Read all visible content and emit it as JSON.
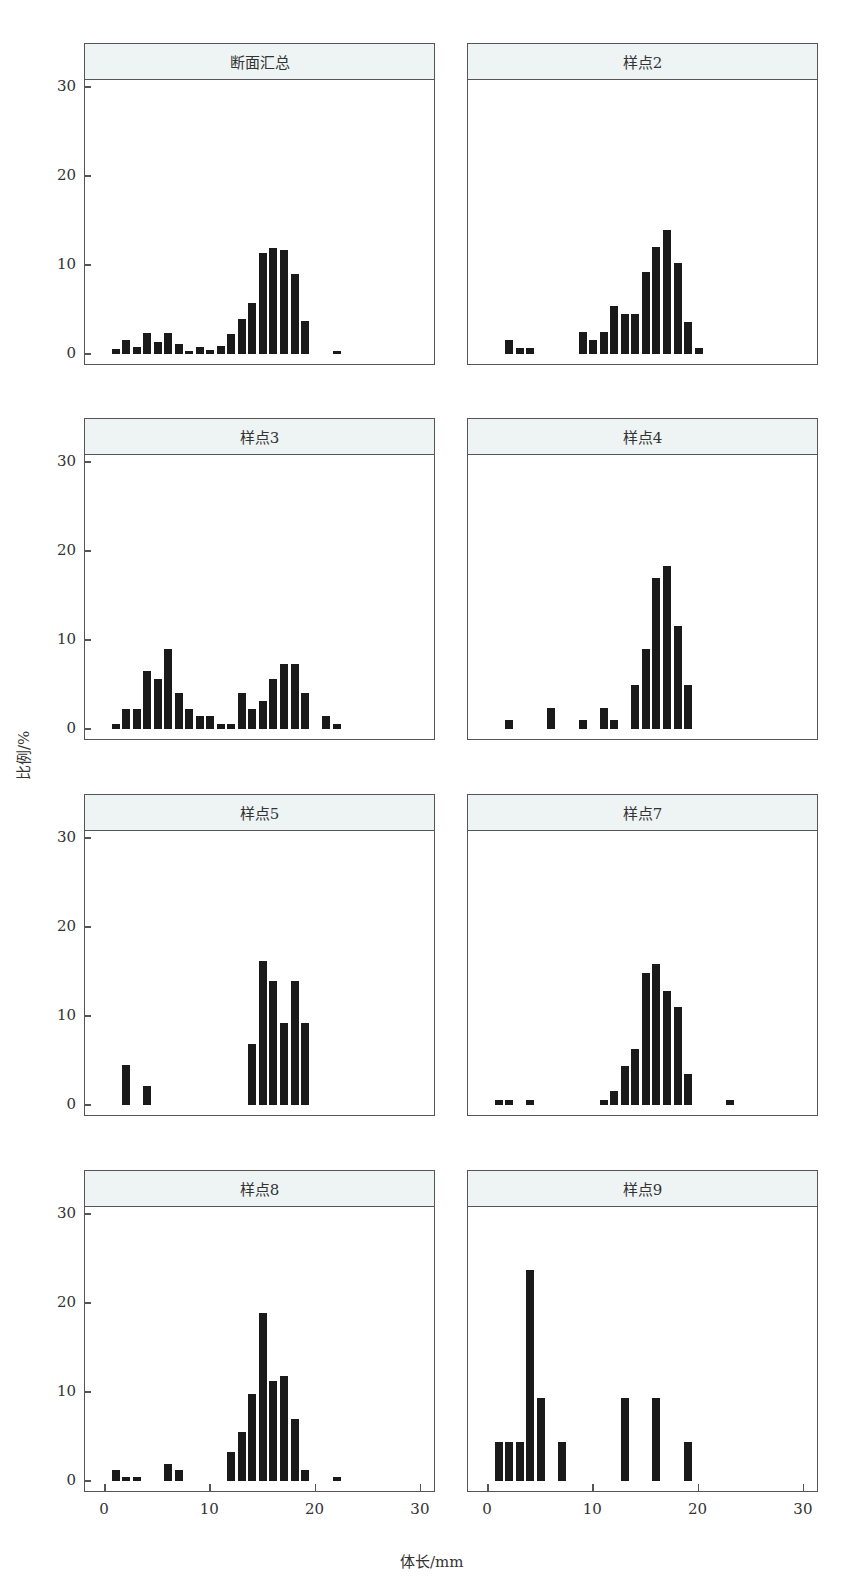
{
  "chart_data": {
    "type": "bar",
    "layout": "facet-grid 4x2",
    "xlabel": "体长/mm",
    "ylabel": "比例/%",
    "xlim": [
      -1,
      31
    ],
    "ylim": [
      0,
      30
    ],
    "xticks": [
      0,
      10,
      20,
      30
    ],
    "yticks": [
      0,
      10,
      20,
      30
    ],
    "grid": false,
    "panels": [
      {
        "title": "断面汇总",
        "x": [
          1,
          2,
          3,
          4,
          5,
          6,
          7,
          8,
          9,
          10,
          11,
          12,
          13,
          14,
          15,
          16,
          17,
          18,
          19,
          22
        ],
        "values": [
          0.6,
          1.6,
          0.8,
          2.4,
          1.3,
          2.4,
          1.1,
          0.3,
          0.8,
          0.5,
          0.9,
          2.3,
          3.9,
          5.7,
          11.4,
          11.9,
          11.7,
          9.0,
          3.7,
          0.3
        ]
      },
      {
        "title": "样点2",
        "x": [
          2,
          3,
          4,
          9,
          10,
          11,
          12,
          13,
          14,
          15,
          16,
          17,
          18,
          19,
          20
        ],
        "values": [
          1.6,
          0.7,
          0.7,
          2.5,
          1.6,
          2.5,
          5.4,
          4.5,
          4.5,
          9.2,
          12.0,
          13.9,
          10.2,
          3.6,
          0.7
        ]
      },
      {
        "title": "样点3",
        "x": [
          1,
          2,
          3,
          4,
          5,
          6,
          7,
          8,
          9,
          10,
          11,
          12,
          13,
          14,
          15,
          16,
          17,
          18,
          19,
          21,
          22
        ],
        "values": [
          0.6,
          2.3,
          2.3,
          6.5,
          5.6,
          9.0,
          4.0,
          2.3,
          1.5,
          1.5,
          0.6,
          0.6,
          4.0,
          2.3,
          3.1,
          5.6,
          7.3,
          7.3,
          4.0,
          1.5,
          0.6
        ]
      },
      {
        "title": "样点4",
        "x": [
          2,
          6,
          9,
          11,
          12,
          14,
          15,
          16,
          17,
          18,
          19
        ],
        "values": [
          1.0,
          2.4,
          1.0,
          2.4,
          1.0,
          5.0,
          9.0,
          17.0,
          18.3,
          11.6,
          5.0
        ]
      },
      {
        "title": "样点5",
        "x": [
          2,
          4,
          14,
          15,
          16,
          17,
          18,
          19
        ],
        "values": [
          4.5,
          2.1,
          6.8,
          16.2,
          13.9,
          9.2,
          13.9,
          9.2
        ]
      },
      {
        "title": "样点7",
        "x": [
          1,
          2,
          4,
          11,
          12,
          13,
          14,
          15,
          16,
          17,
          18,
          19,
          23
        ],
        "values": [
          0.6,
          0.6,
          0.6,
          0.6,
          1.6,
          4.4,
          6.3,
          14.8,
          15.8,
          12.8,
          11.0,
          3.5,
          0.6
        ]
      },
      {
        "title": "样点8",
        "x": [
          1,
          2,
          3,
          6,
          7,
          12,
          13,
          14,
          15,
          16,
          17,
          18,
          19,
          22
        ],
        "values": [
          1.2,
          0.5,
          0.5,
          1.9,
          1.2,
          3.3,
          5.5,
          9.8,
          18.9,
          11.2,
          11.8,
          7.0,
          1.2,
          0.5
        ]
      },
      {
        "title": "样点9",
        "x": [
          1,
          2,
          3,
          4,
          5,
          7,
          13,
          16,
          19
        ],
        "values": [
          4.4,
          4.4,
          4.4,
          23.7,
          9.3,
          4.4,
          9.3,
          9.3,
          4.4
        ]
      }
    ]
  },
  "figure": {
    "y_axis_title": "比例/%",
    "x_axis_title": "体长/mm",
    "ytick_labels": [
      "0",
      "10",
      "20",
      "30"
    ],
    "xtick_labels": [
      "0",
      "10",
      "20",
      "30"
    ]
  }
}
